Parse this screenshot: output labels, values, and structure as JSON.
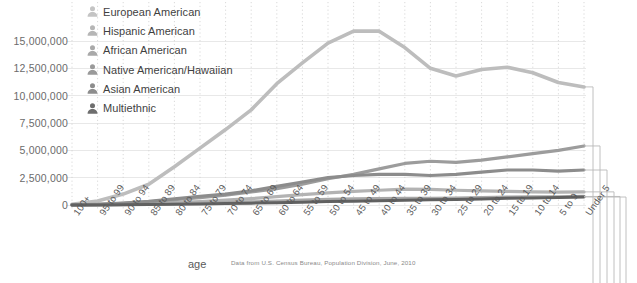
{
  "chart_data": {
    "type": "line",
    "title": "",
    "subtitle": "",
    "xlabel": "age",
    "ylabel": "",
    "source_note": "Data from U.S. Census Bureau, Population Division, June, 2010",
    "grid": {
      "horizontal": true,
      "vertical": true,
      "vertical_style": "dotted"
    },
    "legend_position": "top-left",
    "ylim": [
      0,
      16500000
    ],
    "ytick_values": [
      0,
      2500000,
      5000000,
      7500000,
      10000000,
      12500000,
      15000000
    ],
    "ytick_labels": [
      "0",
      "2,500,000",
      "5,000,000",
      "7,500,000",
      "10,000,000",
      "12,500,000",
      "15,000,000"
    ],
    "categories": [
      "100+",
      "95 to 99",
      "90 to 94",
      "85 to 89",
      "80 to 84",
      "75 to 79",
      "70 to 74",
      "65 to 69",
      "60 to 64",
      "55 to 59",
      "50 to 54",
      "45 to 49",
      "40 to 44",
      "35 to 39",
      "30 to 34",
      "25 to 29",
      "20 to 24",
      "15 to 19",
      "10 to 14",
      "5 to 9",
      "Under 5"
    ],
    "series": [
      {
        "name": "European American",
        "color": "#bdbdbd",
        "values": [
          60000,
          370000,
          1000000,
          1900000,
          3500000,
          5200000,
          6900000,
          8700000,
          11100000,
          13000000,
          14800000,
          15900000,
          15900000,
          14400000,
          12500000,
          11800000,
          12400000,
          12600000,
          12100000,
          11200000,
          10800000
        ]
      },
      {
        "name": "Hispanic American",
        "color": "#9c9c9c",
        "values": [
          10000,
          60000,
          150000,
          290000,
          480000,
          680000,
          900000,
          1200000,
          1500000,
          1900000,
          2400000,
          2800000,
          3300000,
          3800000,
          4000000,
          3900000,
          4100000,
          4400000,
          4700000,
          5000000,
          5400000
        ]
      },
      {
        "name": "African American",
        "color": "#8c8c8c",
        "values": [
          15000,
          70000,
          180000,
          340000,
          560000,
          800000,
          1000000,
          1300000,
          1700000,
          2100000,
          2500000,
          2700000,
          2800000,
          2800000,
          2700000,
          2800000,
          3000000,
          3200000,
          3200000,
          3100000,
          3200000
        ]
      },
      {
        "name": "Native American/Hawaiian",
        "color": "#a8a8a8",
        "values": [
          4000,
          15000,
          35000,
          70000,
          115000,
          165000,
          215000,
          280000,
          360000,
          440000,
          520000,
          570000,
          590000,
          600000,
          610000,
          640000,
          680000,
          720000,
          740000,
          750000,
          780000
        ]
      },
      {
        "name": "Asian American",
        "color": "#b3b3b3",
        "values": [
          5000,
          25000,
          60000,
          120000,
          210000,
          320000,
          440000,
          580000,
          760000,
          940000,
          1100000,
          1250000,
          1350000,
          1450000,
          1420000,
          1350000,
          1300000,
          1250000,
          1200000,
          1180000,
          1200000
        ]
      },
      {
        "name": "Multiethnic",
        "color": "#616161",
        "values": [
          3000,
          10000,
          22000,
          42000,
          70000,
          100000,
          130000,
          170000,
          215000,
          260000,
          310000,
          350000,
          390000,
          430000,
          470000,
          510000,
          560000,
          610000,
          650000,
          690000,
          730000
        ]
      }
    ]
  },
  "legend": {
    "items": [
      {
        "label": "European American",
        "icon": "person-icon",
        "color": "#c4c4c4"
      },
      {
        "label": "Hispanic American",
        "icon": "person-icon",
        "color": "#b6b6b6"
      },
      {
        "label": "African American",
        "icon": "person-icon",
        "color": "#a9a9a9"
      },
      {
        "label": "Native American/Hawaiian",
        "icon": "person-icon",
        "color": "#9a9a9a"
      },
      {
        "label": "Asian American",
        "icon": "person-icon",
        "color": "#8d8d8d"
      },
      {
        "label": "Multiethnic",
        "icon": "person-icon",
        "color": "#6e6e6e"
      }
    ]
  },
  "axes": {
    "x_title": "age"
  },
  "style": {
    "background": "#ffffff",
    "gridline_color": "#e8e8e8",
    "vertical_gridline_color": "#cfcfcf",
    "axis_text_color": "#5a5a5a"
  }
}
